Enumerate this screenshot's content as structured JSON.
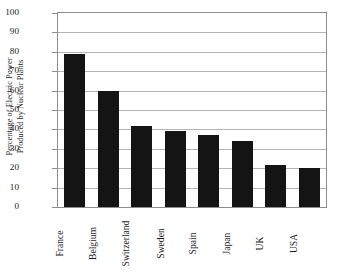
{
  "chart_data": {
    "type": "bar",
    "title": "",
    "xlabel": "",
    "ylabel_lines": [
      "Percentage of Electric Power",
      "Produced by Nuclear Plants"
    ],
    "ylabel": "Percentage of Electric Power Produced by Nuclear Plants",
    "categories": [
      "France",
      "Belgium",
      "Switzerland",
      "Sweden",
      "Spain",
      "Japan",
      "UK",
      "USA"
    ],
    "values": [
      79,
      60,
      42,
      39,
      37,
      34,
      21.5,
      20
    ],
    "ylim": [
      0,
      100
    ],
    "ytick_labels": [
      "100",
      "90",
      "80",
      "70",
      "60",
      "50",
      "40",
      "30",
      "20",
      "10",
      "0"
    ],
    "ytick_values": [
      100,
      90,
      80,
      70,
      60,
      50,
      40,
      30,
      20,
      10,
      0
    ],
    "grid": true,
    "legend": "none",
    "bar_color": "#141414",
    "grid_color": "#b4b4b4",
    "axis_color": "#8d8d8d",
    "background_color": "#ffffff"
  }
}
